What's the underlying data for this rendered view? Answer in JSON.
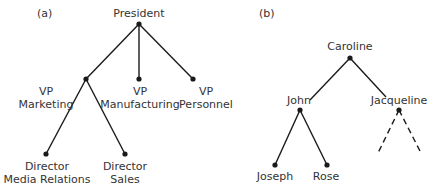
{
  "panels": [
    {
      "label": "(a)",
      "title": "Organization chart tree",
      "root": "President",
      "nodes": {
        "president": "President",
        "vp_marketing": {
          "line1": "VP",
          "line2": "Marketing"
        },
        "vp_manufacturing": {
          "line1": "VP",
          "line2": "Manufacturing"
        },
        "vp_personnel": {
          "line1": "VP",
          "line2": "Personnel"
        },
        "dir_media": {
          "line1": "Director",
          "line2": "Media Relations"
        },
        "dir_sales": {
          "line1": "Director",
          "line2": "Sales"
        }
      },
      "edges": [
        [
          "President",
          "VP Marketing"
        ],
        [
          "President",
          "VP Manufacturing"
        ],
        [
          "President",
          "VP Personnel"
        ],
        [
          "VP Marketing",
          "Director Media Relations"
        ],
        [
          "VP Marketing",
          "Director Sales"
        ]
      ]
    },
    {
      "label": "(b)",
      "title": "Family tree",
      "root": "Caroline",
      "nodes": {
        "caroline": "Caroline",
        "john": "John",
        "jacqueline": "Jacqueline",
        "joseph": "Joseph",
        "rose": "Rose"
      },
      "edges": [
        [
          "Caroline",
          "John"
        ],
        [
          "Caroline",
          "Jacqueline"
        ],
        [
          "John",
          "Joseph"
        ],
        [
          "John",
          "Rose"
        ]
      ],
      "dashed_edges": [
        [
          "Jacqueline",
          "unknown-left"
        ],
        [
          "Jacqueline",
          "unknown-right"
        ]
      ]
    }
  ],
  "colors": {
    "line": "#1a1a1a",
    "text": "#333333",
    "background": "#ffffff"
  }
}
